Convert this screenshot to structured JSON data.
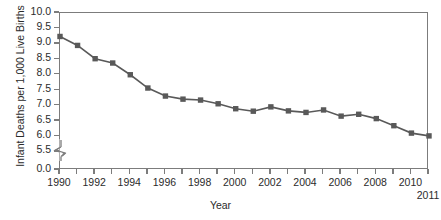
{
  "chart_data": {
    "type": "line",
    "title": "",
    "xlabel": "Year",
    "ylabel": "Infant Deaths per 1,000 Live Births",
    "xlim": [
      1990,
      2011
    ],
    "ylim": [
      5.5,
      10.0
    ],
    "y_axis_break": true,
    "y_break_from": 5.5,
    "y_break_to": 0.0,
    "grid": false,
    "legend": null,
    "marker": "square",
    "series_color": "#595959",
    "x": [
      1990,
      1991,
      1992,
      1993,
      1994,
      1995,
      1996,
      1997,
      1998,
      1999,
      2000,
      2001,
      2002,
      2003,
      2004,
      2005,
      2006,
      2007,
      2008,
      2009,
      2010,
      2011
    ],
    "values": [
      9.24,
      8.95,
      8.52,
      8.38,
      8.0,
      7.57,
      7.31,
      7.21,
      7.18,
      7.06,
      6.9,
      6.82,
      6.96,
      6.83,
      6.78,
      6.86,
      6.66,
      6.72,
      6.58,
      6.35,
      6.11,
      6.02
    ],
    "series": [
      {
        "name": "Infant mortality rate",
        "values": [
          9.24,
          8.95,
          8.52,
          8.38,
          8.0,
          7.57,
          7.31,
          7.21,
          7.18,
          7.06,
          6.9,
          6.82,
          6.96,
          6.83,
          6.78,
          6.86,
          6.66,
          6.72,
          6.58,
          6.35,
          6.11,
          6.02
        ]
      }
    ],
    "ytick_labels": [
      "10.0",
      "9.5",
      "9.0",
      "8.5",
      "8.0",
      "7.5",
      "7.0",
      "6.5",
      "6.0",
      "5.5",
      "0.0"
    ],
    "ytick_values": [
      10.0,
      9.5,
      9.0,
      8.5,
      8.0,
      7.5,
      7.0,
      6.5,
      6.0,
      5.5,
      0.0
    ],
    "xtick_labels": [
      "1990",
      "1992",
      "1994",
      "1996",
      "1998",
      "2000",
      "2002",
      "2004",
      "2006",
      "2008",
      "2010",
      "2011"
    ],
    "xtick_values": [
      1990,
      1992,
      1994,
      1996,
      1998,
      2000,
      2002,
      2004,
      2006,
      2008,
      2010,
      2011
    ]
  },
  "colors": {
    "series": "#595959",
    "axis": "#7c7c7c",
    "text": "#2b2b2b",
    "background": "#ffffff"
  }
}
